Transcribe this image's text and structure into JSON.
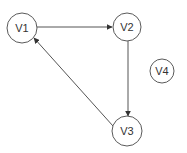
{
  "graph": {
    "directed": true,
    "colors": {
      "node_stroke": "#5a5a5a",
      "edge": "#555555",
      "label": "#333333",
      "background": "#ffffff"
    },
    "nodes": [
      {
        "id": "V1",
        "label": "V1",
        "cx": 22,
        "cy": 28,
        "r": 15
      },
      {
        "id": "V2",
        "label": "V2",
        "cx": 127,
        "cy": 27,
        "r": 14
      },
      {
        "id": "V3",
        "label": "V3",
        "cx": 127,
        "cy": 131,
        "r": 15
      },
      {
        "id": "V4",
        "label": "V4",
        "cx": 162,
        "cy": 71,
        "r": 12
      }
    ],
    "edges": [
      {
        "from": "V1",
        "to": "V2",
        "x1": 37,
        "y1": 27,
        "x2": 112,
        "y2": 27
      },
      {
        "from": "V2",
        "to": "V3",
        "x1": 128,
        "y1": 41,
        "x2": 128,
        "y2": 116
      },
      {
        "from": "V3",
        "to": "V1",
        "x1": 113,
        "y1": 126,
        "x2": 34,
        "y2": 38
      }
    ]
  }
}
